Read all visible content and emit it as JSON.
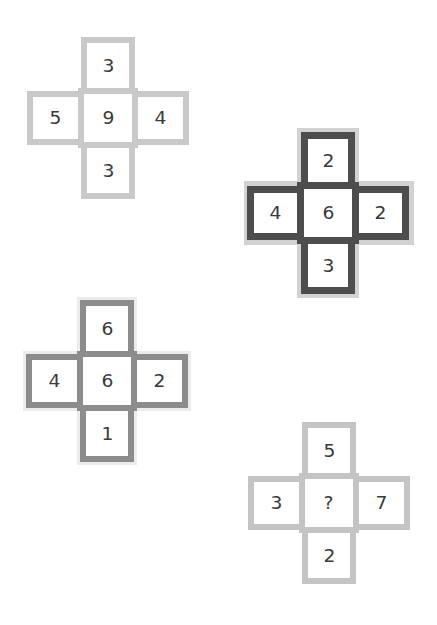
{
  "puzzle": {
    "crosses": [
      {
        "id": "cross-1",
        "style": "light",
        "border_color": "#c9c9c9",
        "top": "3",
        "left": "5",
        "center": "9",
        "right": "4",
        "bottom": "3"
      },
      {
        "id": "cross-2",
        "style": "dark",
        "border_color": "#4d4d4d",
        "top": "2",
        "left": "4",
        "center": "6",
        "right": "2",
        "bottom": "3"
      },
      {
        "id": "cross-3",
        "style": "medium",
        "border_color": "#8c8c8c",
        "top": "6",
        "left": "4",
        "center": "6",
        "right": "2",
        "bottom": "1"
      },
      {
        "id": "cross-4",
        "style": "light",
        "border_color": "#c4c4c4",
        "top": "5",
        "left": "3",
        "center": "?",
        "right": "7",
        "bottom": "2"
      }
    ]
  }
}
